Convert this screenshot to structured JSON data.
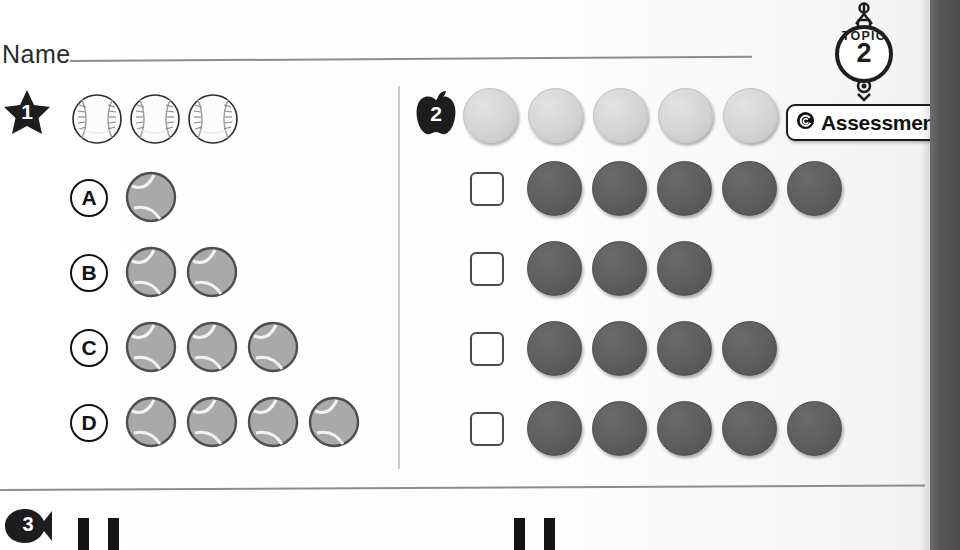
{
  "worksheet": {
    "name_label": "Name",
    "topic": {
      "word": "TOPIC",
      "number": "2"
    },
    "assessment": {
      "label": "Assessment",
      "icon": "copyright-spiral-icon"
    }
  },
  "exercises": [
    {
      "number": "1",
      "badge_shape": "star",
      "prompt_objects": {
        "icon": "baseball-icon",
        "count": 3
      },
      "options": [
        {
          "letter": "A",
          "icon": "tennis-ball-icon",
          "count": 1
        },
        {
          "letter": "B",
          "icon": "tennis-ball-icon",
          "count": 2
        },
        {
          "letter": "C",
          "icon": "tennis-ball-icon",
          "count": 3
        },
        {
          "letter": "D",
          "icon": "tennis-ball-icon",
          "count": 4
        }
      ]
    },
    {
      "number": "2",
      "badge_shape": "apple",
      "reference_row": {
        "icon": "counter-light-icon",
        "count": 5
      },
      "choice_rows": [
        {
          "checkbox": "unchecked",
          "icon": "counter-dark-icon",
          "count": 5
        },
        {
          "checkbox": "unchecked",
          "icon": "counter-dark-icon",
          "count": 3
        },
        {
          "checkbox": "unchecked",
          "icon": "counter-dark-icon",
          "count": 4
        },
        {
          "checkbox": "unchecked",
          "icon": "counter-dark-icon",
          "count": 5
        }
      ]
    },
    {
      "number": "3",
      "badge_shape": "fish",
      "tally_groups": [
        {
          "count": 2
        },
        {
          "count": 2
        }
      ]
    }
  ],
  "colors": {
    "counter_light": "#d4d4d4",
    "counter_dark": "#5d5d5d",
    "tennis_ball": "#a9a9a9",
    "ink": "#111111",
    "rule": "#8d8d8d",
    "page_edge": "#575757"
  }
}
